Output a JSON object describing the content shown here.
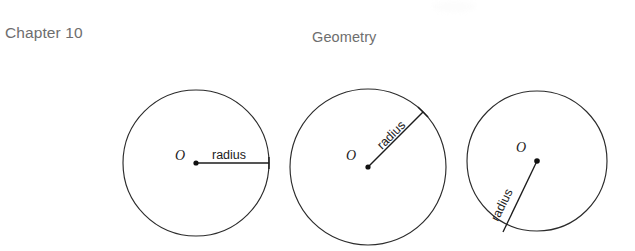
{
  "page": {
    "background_color": "#ffffff",
    "width": 635,
    "height": 251
  },
  "header": {
    "chapter_label": "Chapter 10",
    "section_title": "Geometry",
    "text_color": "#6e6e6e"
  },
  "figure": {
    "caption_terms": {
      "center_label": "O",
      "radius_label": "radius"
    },
    "stroke_color": "#2b2b2b",
    "line_color": "#1c1c1c",
    "circles": [
      {
        "name": "circle-horizontal-radius",
        "center_label": "O",
        "radius_label": "radius",
        "cx": 196,
        "cy": 163,
        "r": 73,
        "radius_endpoint_x": 269,
        "radius_endpoint_y": 163,
        "radius_angle_degrees": 0,
        "label_rotation_degrees": 0,
        "label_x": 212,
        "label_y": 159,
        "o_label_x": 180,
        "o_label_y": 160
      },
      {
        "name": "circle-diagonal-up-radius",
        "center_label": "O",
        "radius_label": "radius",
        "cx": 368,
        "cy": 167,
        "r": 78,
        "radius_endpoint_x": 423,
        "radius_endpoint_y": 112,
        "radius_angle_degrees": 45,
        "label_rotation_degrees": -45,
        "label_x": 382,
        "label_y": 150,
        "o_label_x": 351,
        "o_label_y": 160
      },
      {
        "name": "circle-diagonal-down-radius",
        "center_label": "O",
        "radius_label": "radius",
        "cx": 537,
        "cy": 161,
        "r": 70,
        "radius_endpoint_x": 503,
        "radius_endpoint_y": 232,
        "radius_angle_degrees": 244,
        "label_rotation_degrees": -64,
        "label_x": 514,
        "label_y": 216,
        "o_label_x": 521,
        "o_label_y": 152
      }
    ]
  }
}
